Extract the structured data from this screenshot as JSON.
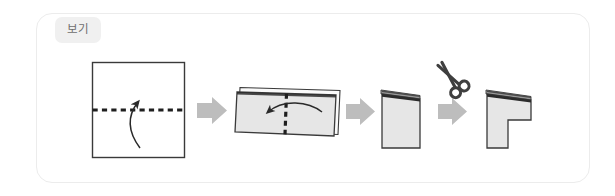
{
  "panel": {
    "border_color": "#ececec",
    "background": "#ffffff"
  },
  "badge": {
    "label": "보기",
    "background": "#f0f0f0",
    "text_color": "#6e6e6e"
  },
  "palette": {
    "paper_fill": "#e6e6e6",
    "paper_fill_light": "#ffffff",
    "paper_stroke": "#3a3a3a",
    "fold_shadow": "#2b2b2b",
    "arrow_gray": "#bdbdbd",
    "dotted_line": "#1e1e1e",
    "scissors": "#3f3f3f"
  },
  "steps": [
    {
      "index": 1,
      "name": "flat-square-sheet",
      "shape": "square",
      "fill": "#ffffff",
      "fold_line": "horizontal-dotted",
      "fold_arrow": "curved-up",
      "caption": ""
    },
    {
      "index": 2,
      "name": "once-folded-sheet",
      "shape": "tilted-rectangle-stack",
      "fill": "#e6e6e6",
      "fold_line": "vertical-dotted",
      "fold_arrow": "curved-left",
      "caption": ""
    },
    {
      "index": 3,
      "name": "twice-folded-booklet",
      "shape": "rectangle-stack",
      "fill": "#e6e6e6",
      "fold_line": "none",
      "fold_arrow": "none",
      "caption": ""
    },
    {
      "index": 4,
      "name": "cut-booklet-notched",
      "shape": "gamma-notched-rectangle",
      "fill": "#e6e6e6",
      "fold_line": "none",
      "fold_arrow": "none",
      "caption": ""
    }
  ],
  "connectors": [
    {
      "name": "step-arrow-1",
      "direction": "right",
      "color": "#bdbdbd"
    },
    {
      "name": "step-arrow-2",
      "direction": "right",
      "color": "#bdbdbd"
    },
    {
      "name": "step-arrow-3",
      "direction": "right",
      "color": "#bdbdbd"
    }
  ],
  "tool_icon": {
    "name": "scissors-icon",
    "glyph": "✂",
    "color": "#3f3f3f"
  }
}
